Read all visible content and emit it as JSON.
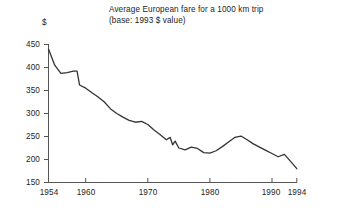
{
  "chart_data": {
    "type": "line",
    "title": "Average European fare for a 1000 km trip",
    "subtitle": "(base: 1993 $ value)",
    "xlabel": "",
    "ylabel": "$",
    "ylim": [
      150,
      450
    ],
    "xlim": [
      1954,
      1994
    ],
    "grid": false,
    "legend": null,
    "y_ticks": [
      450,
      400,
      350,
      300,
      250,
      200,
      150
    ],
    "x_ticks": [
      1954,
      1960,
      1970,
      1980,
      1990,
      1994
    ],
    "line_color": "#333333",
    "series": [
      {
        "name": "Average European fare",
        "x": [
          1954,
          1955,
          1956,
          1957,
          1958,
          1958.6,
          1959,
          1960,
          1961,
          1962,
          1963,
          1964,
          1965,
          1966,
          1967,
          1968,
          1969,
          1970,
          1971,
          1972,
          1973,
          1973.6,
          1974,
          1974.4,
          1975,
          1976,
          1977,
          1978,
          1979,
          1980,
          1981,
          1982,
          1983,
          1984,
          1985,
          1986,
          1987,
          1988,
          1989,
          1990,
          1991,
          1992,
          1993,
          1994
        ],
        "values": [
          440,
          405,
          387,
          389,
          392,
          392,
          362,
          355,
          345,
          336,
          325,
          310,
          300,
          292,
          285,
          281,
          283,
          276,
          264,
          254,
          243,
          248,
          232,
          240,
          225,
          221,
          227,
          224,
          215,
          214,
          219,
          228,
          238,
          248,
          251,
          243,
          234,
          227,
          220,
          213,
          206,
          211,
          196,
          180
        ]
      }
    ]
  },
  "axes": {
    "y_tick_labels": [
      "450",
      "400",
      "350",
      "300",
      "250",
      "200",
      "150"
    ],
    "x_tick_labels": [
      "1954",
      "1960",
      "1970",
      "1980",
      "1990",
      "1994"
    ],
    "currency_symbol": "$"
  }
}
